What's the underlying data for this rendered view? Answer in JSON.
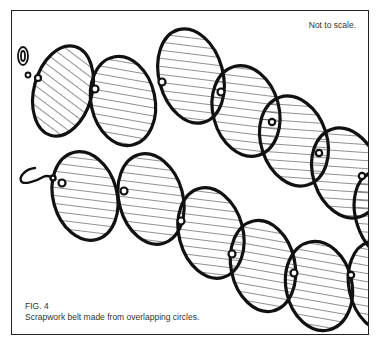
{
  "figure": {
    "note": "Not to scale.",
    "label": "FIG. 4",
    "caption": "Scrapwork belt made from overlapping circles.",
    "stroke_color": "#111111",
    "hatch_color": "#222222"
  },
  "diagram": {
    "chains": [
      {
        "name": "upper-belt",
        "start_fastener": "eyelet-loop",
        "circle_count": 7
      },
      {
        "name": "lower-belt",
        "start_fastener": "hook",
        "circle_count": 6
      }
    ]
  }
}
